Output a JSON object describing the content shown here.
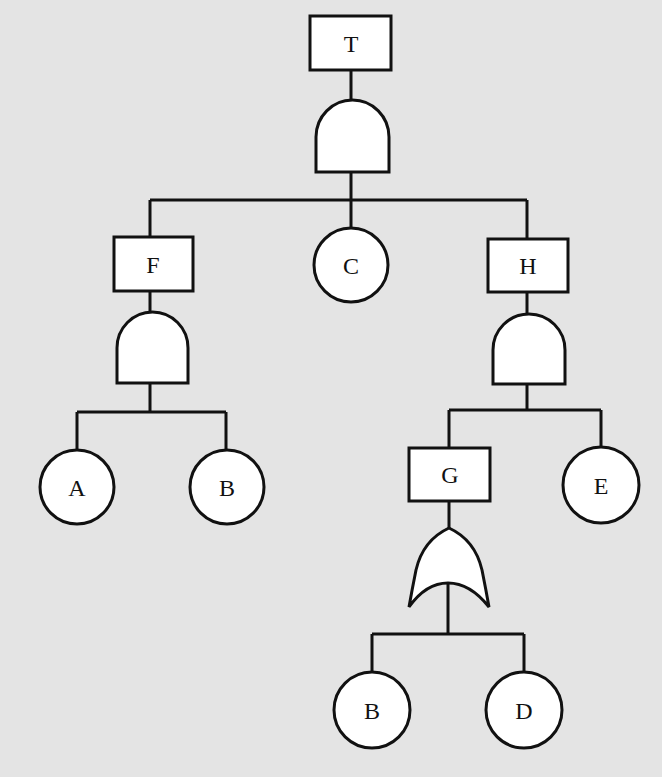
{
  "diagram": {
    "type": "fault-tree",
    "background_color": "#e4e4e4",
    "stroke_color": "#111111",
    "fill_color": "#ffffff",
    "events": {
      "top": {
        "label": "T",
        "kind": "intermediate-event"
      },
      "F": {
        "label": "F",
        "kind": "intermediate-event"
      },
      "H": {
        "label": "H",
        "kind": "intermediate-event"
      },
      "G": {
        "label": "G",
        "kind": "intermediate-event"
      },
      "C": {
        "label": "C",
        "kind": "basic-event"
      },
      "A": {
        "label": "A",
        "kind": "basic-event"
      },
      "B1": {
        "label": "B",
        "kind": "basic-event"
      },
      "E": {
        "label": "E",
        "kind": "basic-event"
      },
      "B2": {
        "label": "B",
        "kind": "basic-event"
      },
      "D": {
        "label": "D",
        "kind": "basic-event"
      }
    },
    "gates": [
      {
        "id": "gate-T",
        "type": "AND",
        "output": "T",
        "inputs": [
          "F",
          "C",
          "H"
        ]
      },
      {
        "id": "gate-F",
        "type": "AND",
        "output": "F",
        "inputs": [
          "A",
          "B"
        ]
      },
      {
        "id": "gate-H",
        "type": "AND",
        "output": "H",
        "inputs": [
          "G",
          "E"
        ]
      },
      {
        "id": "gate-G",
        "type": "OR",
        "output": "G",
        "inputs": [
          "B",
          "D"
        ]
      }
    ]
  }
}
